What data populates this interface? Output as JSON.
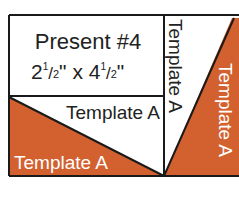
{
  "diagram": {
    "title": "Present #4",
    "size_text_parts": [
      "2",
      "1",
      "/",
      "2",
      "\" x 4",
      "1",
      "/",
      "2",
      "\""
    ],
    "size_text": "2 1/2\" x 4 1/2\"",
    "labels": {
      "top_triangle": "Template A",
      "bottom_triangle": "Template A",
      "vertical_white": "Template A",
      "vertical_orange": "Template A"
    },
    "colors": {
      "orange": "#D2612F",
      "line": "#1a1a1a",
      "white": "#ffffff"
    }
  }
}
